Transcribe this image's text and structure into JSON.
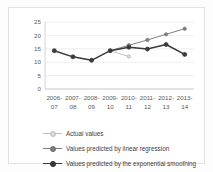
{
  "chart_data": {
    "type": "line",
    "title": "",
    "xlabel": "",
    "ylabel": "",
    "categories": [
      "2006-07",
      "2007-08",
      "2008-09",
      "2009-10",
      "2010-11",
      "2011-12",
      "2012-13",
      "2013-14"
    ],
    "ylim": [
      0,
      25
    ],
    "yticks": [
      0,
      5,
      10,
      15,
      20,
      25
    ],
    "grid": true,
    "legend_position": "bottom-left",
    "series": [
      {
        "name": "Actual values",
        "color": "#bfbfbf",
        "marker": "circle",
        "values": [
          null,
          null,
          null,
          14.3,
          12.1,
          null,
          null,
          null
        ]
      },
      {
        "name": "Values predicted by linear regression",
        "color": "#7f7f7f",
        "marker": "circle",
        "values": [
          null,
          null,
          null,
          14.3,
          16.3,
          18.3,
          20.4,
          22.5
        ]
      },
      {
        "name": "Values predicted by the exponential smoothing",
        "color": "#3a3a3a",
        "marker": "circle",
        "values": [
          14.3,
          12.0,
          10.7,
          14.3,
          15.6,
          14.9,
          16.6,
          12.9
        ]
      }
    ]
  },
  "legend": {
    "items": [
      {
        "label": "Actual values",
        "color": "#bfbfbf"
      },
      {
        "label": "Values predicted by linear regression",
        "color": "#7f7f7f"
      },
      {
        "label": "Values predicted by the exponential smoothing",
        "color": "#3a3a3a"
      }
    ]
  },
  "axis": {
    "y_labels": [
      "25",
      "20",
      "15",
      "10",
      "5",
      "0"
    ],
    "x_labels_top": [
      "2006-",
      "2007-",
      "2008-",
      "2009-",
      "2010-",
      "2011-",
      "2012-",
      "2013-"
    ],
    "x_labels_bottom": [
      "07",
      "08",
      "09",
      "10",
      "11",
      "12",
      "13",
      "14"
    ]
  },
  "colors": {
    "grid": "#e6e6e6",
    "axis": "#c9c9c9",
    "tick_text": "#5a5a5a",
    "legend_text": "#3d3d3d",
    "frame": "#e2e2e2",
    "background": "#ffffff"
  }
}
